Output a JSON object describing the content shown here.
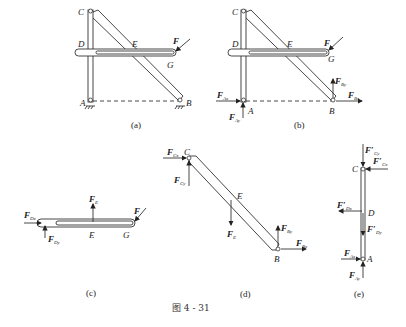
{
  "figure": {
    "caption": "图 4 - 31",
    "panels": [
      {
        "id": "a",
        "label": "(a)",
        "points": [
          "C",
          "D",
          "E",
          "F",
          "G",
          "A",
          "B"
        ]
      },
      {
        "id": "b",
        "label": "(b)",
        "points": [
          "C",
          "D",
          "E",
          "F",
          "G",
          "A",
          "B"
        ],
        "forces": [
          "F_Ax",
          "F_Ay",
          "F_By",
          "F_Bx"
        ]
      },
      {
        "id": "c",
        "label": "(c)",
        "points": [
          "E",
          "G"
        ],
        "forces": [
          "F_Dx",
          "F_Dy",
          "F_E",
          "F"
        ]
      },
      {
        "id": "d",
        "label": "(d)",
        "points": [
          "C",
          "E",
          "B"
        ],
        "forces": [
          "F_Cx",
          "F_Cy",
          "F_E",
          "F_By",
          "F_Bx"
        ]
      },
      {
        "id": "e",
        "label": "(e)",
        "points": [
          "C",
          "D",
          "A"
        ],
        "forces": [
          "F'_Cy",
          "F'_Cx",
          "F'_Dx",
          "F'_Dy",
          "F_Ax",
          "F_Ay"
        ]
      }
    ]
  },
  "labels": {
    "C": "C",
    "D": "D",
    "E": "E",
    "F": "F",
    "G": "G",
    "A": "A",
    "B": "B",
    "cap_a": "(a)",
    "cap_b": "(b)",
    "cap_c": "(c)",
    "cap_d": "(d)",
    "cap_e": "(e)",
    "main": "F",
    "sub_Ax": "Ax",
    "sub_Ay": "Ay",
    "sub_Bx": "Bx",
    "sub_By": "By",
    "sub_Dx": "Dx",
    "sub_Dy": "Dy",
    "sub_E": "E",
    "sub_Cx": "Cx",
    "sub_Cy": "Cy",
    "prime": "F′"
  }
}
